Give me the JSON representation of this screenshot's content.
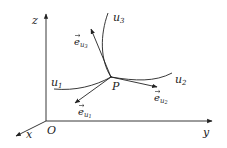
{
  "diagram": {
    "axes": {
      "z_label": "z",
      "y_label": "y",
      "x_label": "x",
      "origin_label": "O"
    },
    "point_label": "P",
    "curves": [
      {
        "name": "u",
        "sub": "1"
      },
      {
        "name": "u",
        "sub": "2"
      },
      {
        "name": "u",
        "sub": "3"
      }
    ],
    "vectors": [
      {
        "name": "e",
        "sub_base": "u",
        "sub_index": "1"
      },
      {
        "name": "e",
        "sub_base": "u",
        "sub_index": "2"
      },
      {
        "name": "e",
        "sub_base": "u",
        "sub_index": "3"
      }
    ],
    "colors": {
      "stroke": "#222222",
      "background": "#ffffff"
    }
  }
}
